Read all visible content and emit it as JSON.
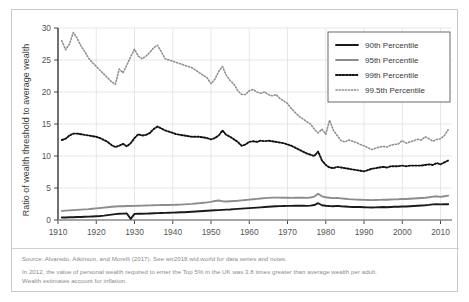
{
  "chart_data": {
    "type": "line",
    "title": "",
    "xlabel": "",
    "ylabel": "Ratio of wealth threshold to average wealth",
    "xlim": [
      1910,
      2013
    ],
    "ylim": [
      0,
      30
    ],
    "xticks": [
      1910,
      1920,
      1930,
      1940,
      1950,
      1960,
      1970,
      1980,
      1990,
      2000,
      2010
    ],
    "yticks": [
      0,
      5,
      10,
      15,
      20,
      25,
      30
    ],
    "grid": true,
    "legend_position": "top-right",
    "series": [
      {
        "name": "90th Percentile",
        "style": "solid",
        "color": "#1a1a1a",
        "width": 1.9,
        "x": [
          1911,
          1912,
          1913,
          1914,
          1915,
          1916,
          1917,
          1918,
          1919,
          1920,
          1921,
          1922,
          1923,
          1924,
          1925,
          1926,
          1927,
          1928,
          1929,
          1930,
          1931,
          1932,
          1933,
          1934,
          1935,
          1936,
          1937,
          1938,
          1939,
          1940,
          1941,
          1942,
          1943,
          1944,
          1945,
          1946,
          1947,
          1948,
          1949,
          1950,
          1951,
          1952,
          1953,
          1954,
          1955,
          1956,
          1957,
          1958,
          1959,
          1960,
          1961,
          1962,
          1963,
          1964,
          1965,
          1966,
          1967,
          1968,
          1969,
          1970,
          1971,
          1972,
          1973,
          1974,
          1975,
          1976,
          1977,
          1978,
          1979,
          1980,
          1981,
          1982,
          1983,
          1984,
          1985,
          1986,
          1987,
          1988,
          1989,
          1990,
          1991,
          1992,
          1993,
          1994,
          1995,
          1996,
          1997,
          1998,
          1999,
          2000,
          2001,
          2002,
          2003,
          2004,
          2005,
          2006,
          2007,
          2008,
          2009,
          2010,
          2011,
          2012
        ],
        "y": [
          0.38,
          0.4,
          0.42,
          0.44,
          0.46,
          0.48,
          0.5,
          0.52,
          0.55,
          0.58,
          0.62,
          0.68,
          0.76,
          0.84,
          0.92,
          0.97,
          1.0,
          1.02,
          0.18,
          0.95,
          0.97,
          0.98,
          1.0,
          1.02,
          1.05,
          1.08,
          1.1,
          1.12,
          1.14,
          1.16,
          1.18,
          1.2,
          1.22,
          1.25,
          1.28,
          1.32,
          1.36,
          1.4,
          1.44,
          1.48,
          1.52,
          1.55,
          1.58,
          1.62,
          1.65,
          1.7,
          1.74,
          1.78,
          1.82,
          1.86,
          1.9,
          1.94,
          1.98,
          2.02,
          2.06,
          2.1,
          2.14,
          2.17,
          2.19,
          2.2,
          2.2,
          2.22,
          2.24,
          2.22,
          2.2,
          2.24,
          2.34,
          2.62,
          2.3,
          2.22,
          2.18,
          2.16,
          2.2,
          2.14,
          2.1,
          2.06,
          2.04,
          2.02,
          2.02,
          2.0,
          1.98,
          1.96,
          1.98,
          2.0,
          2.02,
          2.0,
          2.04,
          2.06,
          2.08,
          2.12,
          2.1,
          2.14,
          2.18,
          2.22,
          2.26,
          2.3,
          2.36,
          2.44,
          2.46,
          2.44,
          2.46,
          2.46
        ]
      },
      {
        "name": "95th Percentile",
        "style": "solid",
        "color": "#8c8c8c",
        "width": 1.9,
        "x": [
          1911,
          1912,
          1913,
          1914,
          1915,
          1916,
          1917,
          1918,
          1919,
          1920,
          1921,
          1922,
          1923,
          1924,
          1925,
          1926,
          1927,
          1928,
          1929,
          1930,
          1931,
          1932,
          1933,
          1934,
          1935,
          1936,
          1937,
          1938,
          1939,
          1940,
          1941,
          1942,
          1943,
          1944,
          1945,
          1946,
          1947,
          1948,
          1949,
          1950,
          1951,
          1952,
          1953,
          1954,
          1955,
          1956,
          1957,
          1958,
          1959,
          1960,
          1961,
          1962,
          1963,
          1964,
          1965,
          1966,
          1967,
          1968,
          1969,
          1970,
          1971,
          1972,
          1973,
          1974,
          1975,
          1976,
          1977,
          1978,
          1979,
          1980,
          1981,
          1982,
          1983,
          1984,
          1985,
          1986,
          1987,
          1988,
          1989,
          1990,
          1991,
          1992,
          1993,
          1994,
          1995,
          1996,
          1997,
          1998,
          1999,
          2000,
          2001,
          2002,
          2003,
          2004,
          2005,
          2006,
          2007,
          2008,
          2009,
          2010,
          2011,
          2012
        ],
        "y": [
          1.42,
          1.46,
          1.5,
          1.54,
          1.58,
          1.62,
          1.66,
          1.7,
          1.76,
          1.82,
          1.88,
          1.94,
          2.0,
          2.06,
          2.12,
          2.14,
          2.16,
          2.18,
          2.18,
          2.2,
          2.22,
          2.24,
          2.26,
          2.28,
          2.3,
          2.32,
          2.34,
          2.34,
          2.34,
          2.36,
          2.38,
          2.4,
          2.44,
          2.48,
          2.52,
          2.58,
          2.64,
          2.7,
          2.76,
          2.84,
          2.98,
          3.04,
          2.94,
          2.88,
          2.92,
          2.96,
          3.0,
          3.06,
          3.12,
          3.18,
          3.24,
          3.3,
          3.36,
          3.42,
          3.46,
          3.5,
          3.5,
          3.5,
          3.48,
          3.48,
          3.46,
          3.48,
          3.5,
          3.48,
          3.46,
          3.52,
          3.66,
          4.1,
          3.7,
          3.56,
          3.48,
          3.42,
          3.44,
          3.38,
          3.32,
          3.26,
          3.22,
          3.18,
          3.16,
          3.14,
          3.12,
          3.1,
          3.12,
          3.14,
          3.16,
          3.16,
          3.2,
          3.22,
          3.24,
          3.3,
          3.28,
          3.32,
          3.36,
          3.4,
          3.44,
          3.48,
          3.56,
          3.66,
          3.7,
          3.62,
          3.72,
          3.8
        ]
      },
      {
        "name": "99th Percentile",
        "style": "dotted",
        "color": "#111111",
        "width": 1.9,
        "x": [
          1911,
          1912,
          1913,
          1914,
          1915,
          1916,
          1917,
          1918,
          1919,
          1920,
          1921,
          1922,
          1923,
          1924,
          1925,
          1926,
          1927,
          1928,
          1929,
          1930,
          1931,
          1932,
          1933,
          1934,
          1935,
          1936,
          1937,
          1938,
          1939,
          1940,
          1941,
          1942,
          1943,
          1944,
          1945,
          1946,
          1947,
          1948,
          1949,
          1950,
          1951,
          1952,
          1953,
          1954,
          1955,
          1956,
          1957,
          1958,
          1959,
          1960,
          1961,
          1962,
          1963,
          1964,
          1965,
          1966,
          1967,
          1968,
          1969,
          1970,
          1971,
          1972,
          1973,
          1974,
          1975,
          1976,
          1977,
          1978,
          1979,
          1980,
          1981,
          1982,
          1983,
          1984,
          1985,
          1986,
          1987,
          1988,
          1989,
          1990,
          1991,
          1992,
          1993,
          1994,
          1995,
          1996,
          1997,
          1998,
          1999,
          2000,
          2001,
          2002,
          2003,
          2004,
          2005,
          2006,
          2007,
          2008,
          2009,
          2010,
          2011,
          2012
        ],
        "y": [
          12.5,
          12.7,
          13.2,
          13.5,
          13.5,
          13.4,
          13.3,
          13.2,
          13.1,
          13.0,
          12.8,
          12.5,
          12.2,
          11.7,
          11.4,
          11.6,
          11.9,
          11.5,
          12.0,
          12.8,
          13.4,
          13.2,
          13.3,
          13.6,
          14.2,
          14.6,
          14.3,
          14.0,
          13.8,
          13.6,
          13.4,
          13.3,
          13.2,
          13.1,
          13.0,
          13.0,
          13.0,
          12.9,
          12.8,
          12.6,
          12.8,
          13.2,
          14.0,
          13.3,
          13.0,
          12.6,
          12.2,
          11.6,
          11.8,
          12.2,
          12.3,
          12.2,
          12.4,
          12.3,
          12.4,
          12.3,
          12.2,
          12.1,
          12.0,
          11.8,
          11.6,
          11.3,
          11.0,
          10.7,
          10.4,
          10.2,
          10.0,
          10.7,
          9.3,
          8.6,
          8.2,
          8.1,
          8.3,
          8.2,
          8.1,
          8.0,
          7.9,
          7.8,
          7.7,
          7.6,
          7.8,
          8.0,
          8.1,
          8.2,
          8.3,
          8.2,
          8.4,
          8.4,
          8.4,
          8.5,
          8.4,
          8.5,
          8.5,
          8.5,
          8.5,
          8.6,
          8.7,
          8.6,
          8.9,
          8.7,
          9.0,
          9.3
        ]
      },
      {
        "name": "99.5th Percentile",
        "style": "dotted-fine",
        "color": "#8f8f8f",
        "width": 1.6,
        "x": [
          1911,
          1912,
          1913,
          1914,
          1915,
          1916,
          1917,
          1918,
          1919,
          1920,
          1921,
          1922,
          1923,
          1924,
          1925,
          1926,
          1927,
          1928,
          1929,
          1930,
          1931,
          1932,
          1933,
          1934,
          1935,
          1936,
          1937,
          1938,
          1939,
          1940,
          1941,
          1942,
          1943,
          1944,
          1945,
          1946,
          1947,
          1948,
          1949,
          1950,
          1951,
          1952,
          1953,
          1954,
          1955,
          1956,
          1957,
          1958,
          1959,
          1960,
          1961,
          1962,
          1963,
          1964,
          1965,
          1966,
          1967,
          1968,
          1969,
          1970,
          1971,
          1972,
          1973,
          1974,
          1975,
          1976,
          1977,
          1978,
          1979,
          1980,
          1981,
          1982,
          1983,
          1984,
          1985,
          1986,
          1987,
          1988,
          1989,
          1990,
          1991,
          1992,
          1993,
          1994,
          1995,
          1996,
          1997,
          1998,
          1999,
          2000,
          2001,
          2002,
          2003,
          2004,
          2005,
          2006,
          2007,
          2008,
          2009,
          2010,
          2011,
          2012
        ],
        "y": [
          28.0,
          26.6,
          27.5,
          29.3,
          28.4,
          27.2,
          26.3,
          25.3,
          24.6,
          24.0,
          23.4,
          22.8,
          22.2,
          21.6,
          21.2,
          23.6,
          23.0,
          24.2,
          25.5,
          26.7,
          25.6,
          25.2,
          25.6,
          26.2,
          26.9,
          27.3,
          26.3,
          25.2,
          25.0,
          24.8,
          24.6,
          24.4,
          24.2,
          24.0,
          23.8,
          23.4,
          23.0,
          22.6,
          22.2,
          21.3,
          22.0,
          23.2,
          24.0,
          22.6,
          21.8,
          21.2,
          20.2,
          19.6,
          19.6,
          20.2,
          20.4,
          20.0,
          19.8,
          20.0,
          19.6,
          19.4,
          19.6,
          19.0,
          18.6,
          18.2,
          17.4,
          16.8,
          16.2,
          15.8,
          15.4,
          15.0,
          14.2,
          13.6,
          14.2,
          13.4,
          15.6,
          14.0,
          13.2,
          12.4,
          12.2,
          12.5,
          12.3,
          12.1,
          11.8,
          11.6,
          11.3,
          11.0,
          11.2,
          11.4,
          11.5,
          11.4,
          11.7,
          11.8,
          11.9,
          12.4,
          12.0,
          12.2,
          12.4,
          12.6,
          12.5,
          13.0,
          12.7,
          12.3,
          12.6,
          12.7,
          13.2,
          14.1
        ]
      }
    ]
  },
  "legend": {
    "items": [
      {
        "label": "90th Percentile"
      },
      {
        "label": "95th Percentile"
      },
      {
        "label": "99th Percentile"
      },
      {
        "label": "99.5th Percentile"
      }
    ]
  },
  "footer": {
    "source": "Source: Alvaredo, Atkinson, and Morelli (2017). See wir2018.wid.world for data series and notes.",
    "note_line1": "In 2012, the value of personal wealth required to enter the Top 5% in the UK was 3.8 times greater than average wealth per adult.",
    "note_line2": "Wealth estimates account for inflation."
  },
  "colors": {
    "axis": "#4a4a4a",
    "grid": "#dcdcdc",
    "border": "#c9c9c9",
    "footer_text": "#8b8b8b"
  }
}
